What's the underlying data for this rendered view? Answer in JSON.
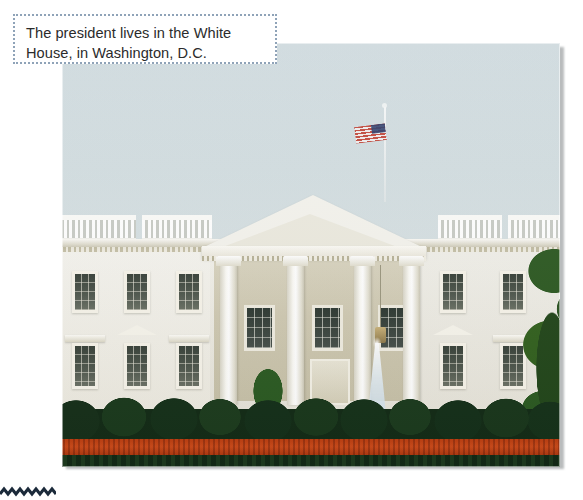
{
  "page": {
    "background_color": "#ffffff",
    "width": 583,
    "height": 500
  },
  "caption": {
    "text": "The president lives in the White\nHouse, in Washington, D.C.",
    "line_1": "The president lives in the White",
    "line_2": "House, in Washington, D.C.",
    "border_style": "dotted",
    "border_color": "#8fa3b8",
    "text_color": "#2b2b2b",
    "background_color": "#ffffff"
  },
  "photo": {
    "alt": "Photograph of the White House north facade with fountain, hedges and red flower bed",
    "subject": "The White House",
    "elements": {
      "sky_color": "#d2dde0",
      "building_color": "#f2f0e8",
      "flag_name": "american-flag",
      "hedge_color": "#17301a",
      "flowerbed_color": "#c8481a",
      "lawn_color": "#5d8a26",
      "tree_color": "#2c5b23",
      "fountain_name": "water-fountain"
    }
  },
  "ornament": {
    "name": "zigzag-rule",
    "color": "#1b2a3a"
  }
}
